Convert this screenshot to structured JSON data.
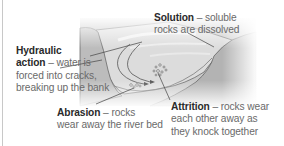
{
  "diagram": {
    "labels": {
      "solution": {
        "term": "Solution",
        "dash": " – ",
        "line1_rest": "soluble",
        "line2": "rocks are dissolved"
      },
      "hydraulic": {
        "term_line1": "Hydraulic",
        "term_line2": "action",
        "dash": " – ",
        "line2_rest": "water is",
        "line3": "forced into cracks,",
        "line4": "breaking up the bank"
      },
      "abrasion": {
        "term": "Abrasion",
        "dash": " – ",
        "line1_rest": "rocks",
        "line2": "wear away the river bed"
      },
      "attrition": {
        "term": "Attrition",
        "dash": " – ",
        "line1_rest": "rocks wear",
        "line2": "each other away as",
        "line3": "they knock together"
      }
    },
    "colors": {
      "bank_left": "#bdbdbd",
      "bank_right": "#b2b2b2",
      "water": "#d9d9d9",
      "water_highlight": "#f2f2f2",
      "line": "#555555",
      "term_text": "#2a2a2a",
      "body_text": "#6a6a6a"
    }
  }
}
